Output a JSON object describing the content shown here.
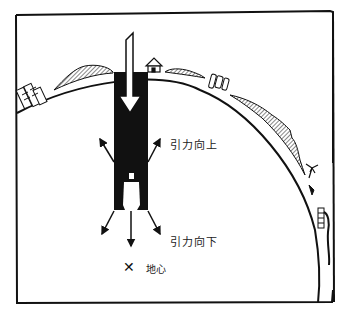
{
  "diagram": {
    "labels": {
      "gravity_up": "引力向上",
      "gravity_down": "引力向下",
      "earth_center": "地心",
      "center_marker": "✕"
    },
    "elements": [
      "earth-surface-arc",
      "hills",
      "buildings",
      "house",
      "palm-tree",
      "cliff-with-waterfall",
      "vertical-shaft",
      "falling-arrow",
      "person-in-shaft",
      "upward-force-arrows",
      "downward-force-arrows"
    ],
    "colors": {
      "ink": "#111111",
      "paper": "#ffffff"
    }
  }
}
